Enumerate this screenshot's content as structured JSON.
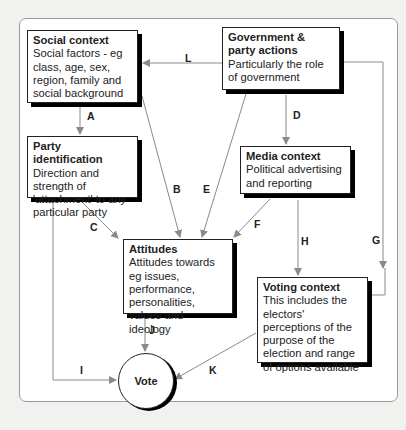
{
  "diagram": {
    "type": "flow-model",
    "nodes": {
      "social": {
        "title": "Social context",
        "body": "Social factors - eg class, age, sex, region, family and social background"
      },
      "government": {
        "title": "Government & party actions",
        "body": "Particularly the role of government"
      },
      "party": {
        "title": "Party identification",
        "body": "Direction and strength of 'attachment' to any particular party"
      },
      "media": {
        "title": "Media context",
        "body": "Political advertising and reporting"
      },
      "attitudes": {
        "title": "Attitudes",
        "body": "Attitudes towards eg issues, performance, personalities, values and ideology"
      },
      "voting": {
        "title": "Voting context",
        "body": "This includes the electors' perceptions of the purpose of the election and range of options available"
      },
      "vote": {
        "title": "Vote"
      }
    },
    "edges": [
      {
        "label": "A",
        "from": "Social context",
        "to": "Party identification"
      },
      {
        "label": "B",
        "from": "Social context",
        "to": "Attitudes"
      },
      {
        "label": "C",
        "from": "Party identification",
        "to": "Attitudes"
      },
      {
        "label": "D",
        "from": "Government & party actions",
        "to": "Media context"
      },
      {
        "label": "E",
        "from": "Government & party actions",
        "to": "Attitudes"
      },
      {
        "label": "F",
        "from": "Media context",
        "to": "Attitudes"
      },
      {
        "label": "G",
        "from": "Government & party actions",
        "to": "Voting context"
      },
      {
        "label": "H",
        "from": "Media context",
        "to": "Voting context"
      },
      {
        "label": "I",
        "from": "Party identification",
        "to": "Vote"
      },
      {
        "label": "J",
        "from": "Attitudes",
        "to": "Vote"
      },
      {
        "label": "K",
        "from": "Voting context",
        "to": "Vote"
      },
      {
        "label": "L",
        "from": "Government & party actions",
        "to": "Social context"
      }
    ],
    "colors": {
      "line": "#8a8a8a",
      "box_border": "#222222",
      "shadow": "#000000",
      "background": "#f1f1f0"
    }
  }
}
